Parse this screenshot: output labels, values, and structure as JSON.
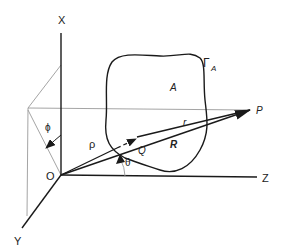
{
  "diagram": {
    "type": "3d-coordinate-geometry",
    "axes": {
      "x_label": "X",
      "y_label": "Y",
      "z_label": "Z",
      "origin_label": "O"
    },
    "region": {
      "area_label": "A",
      "boundary_label": "Γ",
      "boundary_subscript": "A"
    },
    "points": {
      "source_point": "Q",
      "field_point": "P"
    },
    "vectors": {
      "rho": "ρ",
      "r": "r",
      "R": "R"
    },
    "angles": {
      "phi": "ϕ",
      "theta": "θ"
    },
    "colors": {
      "line": "#1a1a1a",
      "guide": "#9a9a9a",
      "background": "#ffffff"
    }
  }
}
